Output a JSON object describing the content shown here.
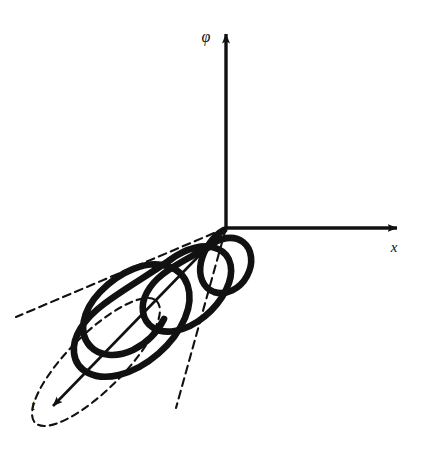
{
  "figure": {
    "background_color": "#ffffff",
    "ink_color": "#111111",
    "width": 431,
    "height": 456
  },
  "axes": [
    {
      "id": "phi",
      "label": "φ",
      "direction": "up",
      "origin": [
        226,
        228
      ],
      "tip": [
        226,
        30
      ],
      "label_position": [
        206,
        42
      ],
      "style": "solid"
    },
    {
      "id": "x",
      "label": "x",
      "direction": "right",
      "origin": [
        226,
        228
      ],
      "tip": [
        401,
        228
      ],
      "label_position": [
        394,
        250
      ],
      "style": "solid"
    },
    {
      "id": "t",
      "label": "t",
      "direction": "down-left",
      "origin": [
        226,
        228
      ],
      "tip": [
        48,
        411
      ],
      "label_position": [
        33,
        407
      ],
      "style": "solid"
    }
  ],
  "cone": {
    "description": "Dashed cone with apex at the coordinate origin, axis along t, elliptical base at the far end",
    "apex": [
      226,
      228
    ],
    "base_center": [
      96,
      362
    ],
    "base_rx": 86,
    "base_ry": 28,
    "base_rotation_deg": -45,
    "edge_style": "dashed",
    "dash_pattern": "7 5",
    "stroke_width": 2
  },
  "spiral": {
    "description": "Bold conical spiral winding around the t-axis, radius growing from the apex toward the base",
    "turns": 3,
    "stroke_width": 6.5,
    "style": "solid",
    "start": "apex",
    "end": "base rim"
  },
  "legend": {
    "caption": ""
  }
}
